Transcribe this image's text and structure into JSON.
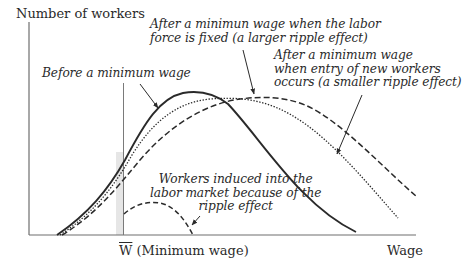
{
  "axes": {
    "y_label": "Number of workers",
    "x_label": "Wage",
    "x_marker_symbol": "W",
    "x_marker_text": " (Minimum wage)"
  },
  "annotations": {
    "before": "Before a minimum wage",
    "fixed_line1": "After a minimun wage when the labor",
    "fixed_line2": "force is fixed (a larger ripple effect)",
    "entry_line1": "After a minimum wage",
    "entry_line2": "when entry of new workers",
    "entry_line3": "occurs (a smaller ripple effect)",
    "induced_line1": "Workers induced into the",
    "induced_line2": "labor market because of the",
    "induced_line3": "ripple effect"
  },
  "colors": {
    "ink": "#2a2a2a",
    "axis": "#6e6e6e",
    "shade": "#e6e6e6"
  },
  "curves": [
    {
      "name": "Before a minimum wage",
      "style": "solid"
    },
    {
      "name": "After minimum wage, labor force fixed (larger ripple effect)",
      "style": "dotted"
    },
    {
      "name": "After minimum wage, entry of new workers (smaller ripple effect)",
      "style": "dashed"
    },
    {
      "name": "Workers induced into the labor market because of the ripple effect",
      "style": "dashed"
    }
  ]
}
